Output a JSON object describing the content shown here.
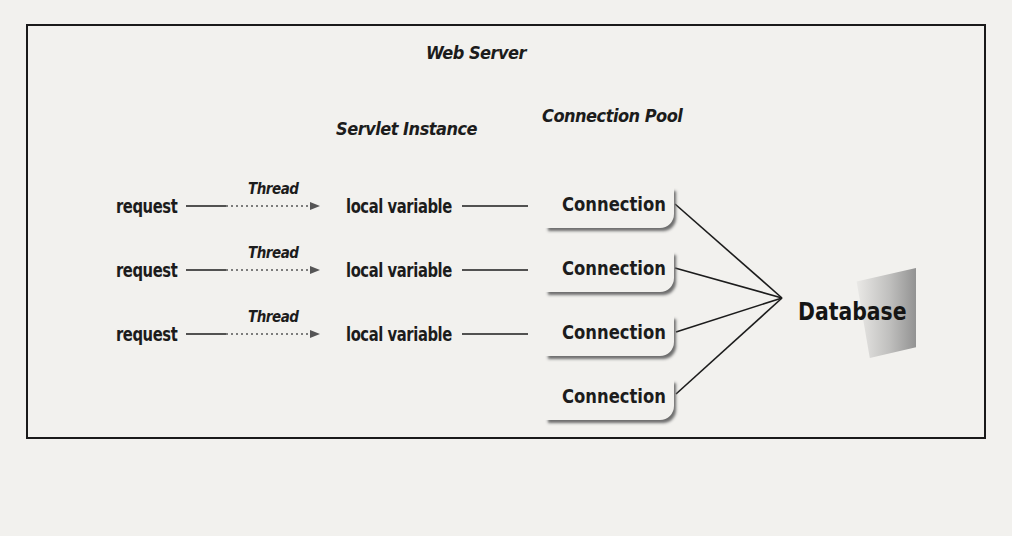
{
  "diagram": {
    "container_label": "Web Server",
    "column_headers": {
      "servlet": "Servlet Instance",
      "pool": "Connection Pool"
    },
    "rows": [
      {
        "request": "request",
        "thread": "Thread",
        "variable": "local variable"
      },
      {
        "request": "request",
        "thread": "Thread",
        "variable": "local variable"
      },
      {
        "request": "request",
        "thread": "Thread",
        "variable": "local variable"
      }
    ],
    "connections": [
      "Connection",
      "Connection",
      "Connection",
      "Connection"
    ],
    "database": "Database"
  }
}
